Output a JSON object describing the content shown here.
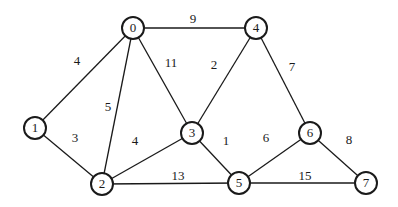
{
  "graph": {
    "type": "weighted-undirected",
    "nodes": [
      {
        "id": "0",
        "label": "0",
        "x": 133,
        "y": 28
      },
      {
        "id": "1",
        "label": "1",
        "x": 35,
        "y": 128
      },
      {
        "id": "2",
        "label": "2",
        "x": 102,
        "y": 184
      },
      {
        "id": "3",
        "label": "3",
        "x": 192,
        "y": 133
      },
      {
        "id": "4",
        "label": "4",
        "x": 256,
        "y": 28
      },
      {
        "id": "5",
        "label": "5",
        "x": 239,
        "y": 183
      },
      {
        "id": "6",
        "label": "6",
        "x": 310,
        "y": 133
      },
      {
        "id": "7",
        "label": "7",
        "x": 366,
        "y": 183
      }
    ],
    "edges": [
      {
        "from": "0",
        "to": "4",
        "weight": "9",
        "lx": 193,
        "ly": 20
      },
      {
        "from": "0",
        "to": "1",
        "weight": "4",
        "lx": 77,
        "ly": 62
      },
      {
        "from": "0",
        "to": "2",
        "weight": "5",
        "lx": 108,
        "ly": 108
      },
      {
        "from": "0",
        "to": "3",
        "weight": "11",
        "lx": 171,
        "ly": 64
      },
      {
        "from": "4",
        "to": "3",
        "weight": "2",
        "lx": 214,
        "ly": 66
      },
      {
        "from": "4",
        "to": "6",
        "weight": "7",
        "lx": 292,
        "ly": 68
      },
      {
        "from": "1",
        "to": "2",
        "weight": "3",
        "lx": 75,
        "ly": 139
      },
      {
        "from": "3",
        "to": "2",
        "weight": "4",
        "lx": 135,
        "ly": 142
      },
      {
        "from": "3",
        "to": "5",
        "weight": "1",
        "lx": 226,
        "ly": 142
      },
      {
        "from": "6",
        "to": "5",
        "weight": "6",
        "lx": 266,
        "ly": 139
      },
      {
        "from": "6",
        "to": "7",
        "weight": "8",
        "lx": 349,
        "ly": 141
      },
      {
        "from": "2",
        "to": "5",
        "weight": "13",
        "lx": 178,
        "ly": 177
      },
      {
        "from": "5",
        "to": "7",
        "weight": "15",
        "lx": 305,
        "ly": 177
      }
    ],
    "node_radius": 11
  }
}
